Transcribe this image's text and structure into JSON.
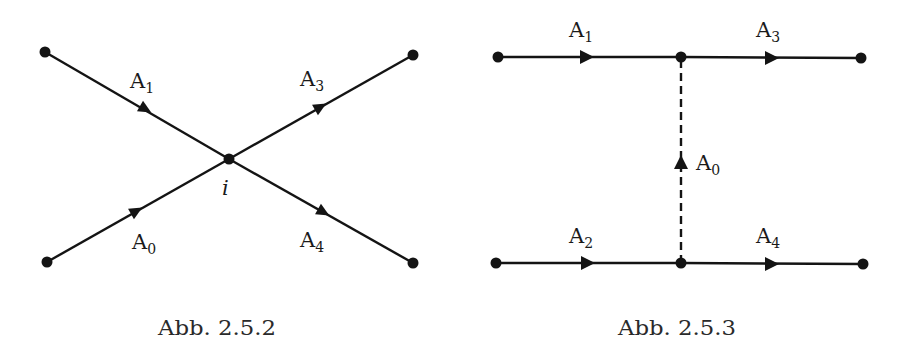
{
  "figures": [
    {
      "id": "abb-2.5.2",
      "caption": "Abb. 2.5.2",
      "vertex_label": "i",
      "edges": [
        {
          "name": "A",
          "sub": "1",
          "from": [
            45,
            52
          ],
          "to": [
            229,
            159
          ]
        },
        {
          "name": "A",
          "sub": "3",
          "from": [
            229,
            159
          ],
          "to": [
            413,
            55
          ]
        },
        {
          "name": "A",
          "sub": "0",
          "from": [
            47,
            262
          ],
          "to": [
            229,
            159
          ]
        },
        {
          "name": "A",
          "sub": "4",
          "from": [
            229,
            159
          ],
          "to": [
            413,
            263
          ]
        }
      ]
    },
    {
      "id": "abb-2.5.3",
      "caption": "Abb. 2.5.3",
      "edges": [
        {
          "name": "A",
          "sub": "1",
          "from": [
            498,
            57
          ],
          "to": [
            681,
            57
          ]
        },
        {
          "name": "A",
          "sub": "3",
          "from": [
            681,
            57
          ],
          "to": [
            861,
            58
          ]
        },
        {
          "name": "A",
          "sub": "2",
          "from": [
            496,
            263
          ],
          "to": [
            681,
            263
          ]
        },
        {
          "name": "A",
          "sub": "4",
          "from": [
            681,
            263
          ],
          "to": [
            863,
            264
          ]
        },
        {
          "name": "A",
          "sub": "0",
          "from": [
            681,
            263
          ],
          "to": [
            681,
            57
          ],
          "style": "dashed"
        }
      ]
    }
  ],
  "labels": {
    "fig1": {
      "a1": "A",
      "a1_sub": "1",
      "a3": "A",
      "a3_sub": "3",
      "a0": "A",
      "a0_sub": "0",
      "a4": "A",
      "a4_sub": "4",
      "vertex": "i",
      "caption": "Abb. 2.5.2"
    },
    "fig2": {
      "a1": "A",
      "a1_sub": "1",
      "a3": "A",
      "a3_sub": "3",
      "a0": "A",
      "a0_sub": "0",
      "a2": "A",
      "a2_sub": "2",
      "a4": "A",
      "a4_sub": "4",
      "caption": "Abb. 2.5.3"
    }
  },
  "colors": {
    "line": "#141414",
    "background": "#ffffff"
  }
}
